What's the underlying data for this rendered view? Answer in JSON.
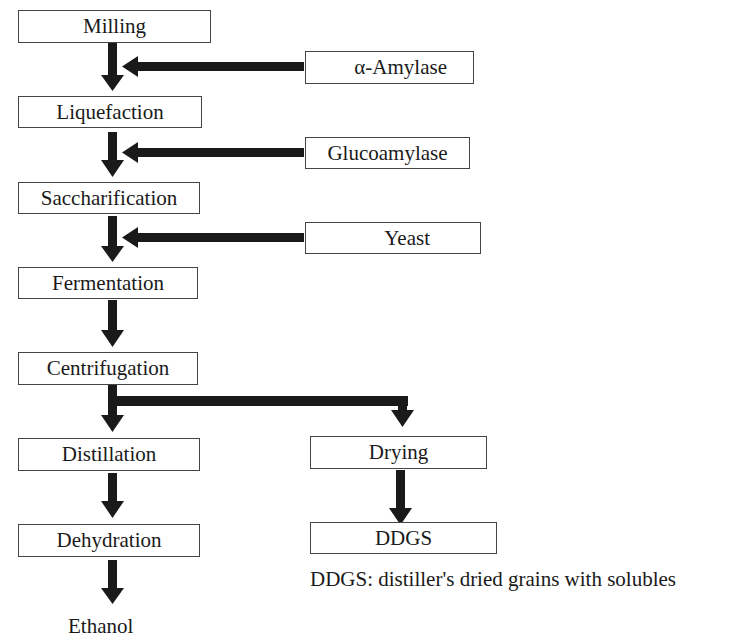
{
  "main_flow": [
    {
      "id": "milling",
      "label": "Milling"
    },
    {
      "id": "liquefaction",
      "label": "Liquefaction"
    },
    {
      "id": "saccharification",
      "label": "Saccharification"
    },
    {
      "id": "fermentation",
      "label": "Fermentation"
    },
    {
      "id": "centrifugation",
      "label": "Centrifugation"
    },
    {
      "id": "distillation",
      "label": "Distillation"
    },
    {
      "id": "dehydration",
      "label": "Dehydration"
    }
  ],
  "inputs": [
    {
      "id": "alpha-amylase",
      "label": "α-Amylase",
      "feeds": "milling→liquefaction"
    },
    {
      "id": "glucoamylase",
      "label": "Glucoamylase",
      "feeds": "liquefaction→saccharification"
    },
    {
      "id": "yeast",
      "label": "Yeast",
      "feeds": "saccharification→fermentation"
    }
  ],
  "side_branch": [
    {
      "id": "drying",
      "label": "Drying"
    },
    {
      "id": "ddgs",
      "label": "DDGS"
    }
  ],
  "outputs": {
    "ethanol": "Ethanol"
  },
  "footnote": "DDGS: distiller's dried grains with solubles",
  "colors": {
    "arrow": "#1a1a1a",
    "border": "#444444"
  }
}
